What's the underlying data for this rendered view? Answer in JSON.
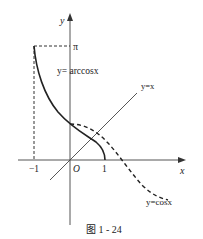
{
  "figure": {
    "caption": "图 1 - 24",
    "axis_labels": {
      "x": "x",
      "y": "y",
      "origin": "O"
    },
    "tick_labels": {
      "neg_one": "−1",
      "one": "1",
      "pi": "π"
    },
    "curve_labels": {
      "arccos": "y= arccosx",
      "identity": "y=x",
      "cos": "y=cosx"
    },
    "colors": {
      "line": "#222222",
      "axis": "#555555"
    }
  }
}
